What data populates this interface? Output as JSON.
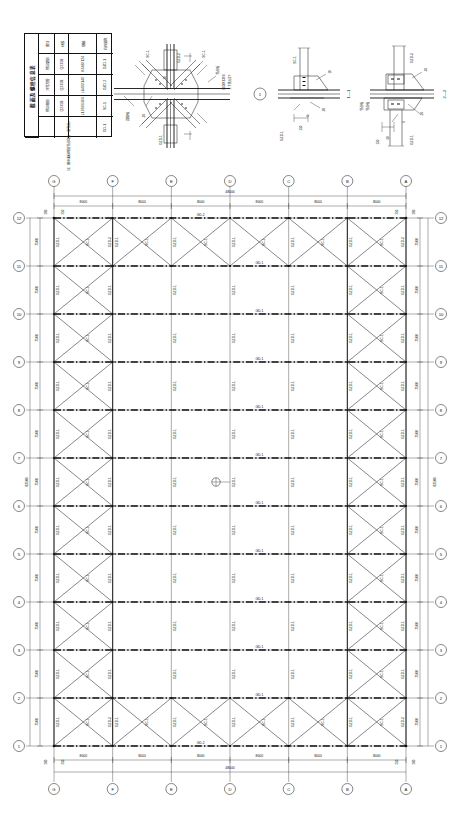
{
  "sheet": {
    "drawing_type": "structural-steel-bracing-plan",
    "units": "mm"
  },
  "material_table": {
    "title": "截面及螺栓信息表",
    "headers": [
      "构件名称",
      "规格",
      "材质",
      "备注"
    ],
    "rows": [
      {
        "name": "GZD-1",
        "spec": "H248X124",
        "material": "Q235B",
        "remark": "热轧型钢"
      },
      {
        "name": "GZD-2",
        "spec": "□140X140",
        "material": "Q235B",
        "remark": "冷弯方管"
      },
      {
        "name": "SC-1",
        "spec": "L100X63X6",
        "material": "Q235B",
        "remark": "热轧角钢"
      },
      {
        "name": "GD-1",
        "spec": "",
        "material": "",
        "remark": ""
      }
    ],
    "note": "注：图中未标明的节点均为一般节点。"
  },
  "details": [
    {
      "id": "detail-1",
      "tag": "1",
      "callouts": [
        "GZD-2",
        "SC-1",
        "SC-1",
        "GZD-1",
        "10",
        "-10",
        "连接板",
        "节点板",
        "L100X63X6",
        "上下各设2个"
      ]
    },
    {
      "id": "section-1-1",
      "tag": "1—1",
      "callouts": [
        "GZD-1",
        "SC-1",
        "10",
        "-10",
        "-20",
        "6",
        "连接板",
        "节点板",
        "150"
      ]
    },
    {
      "id": "section-2-2",
      "tag": "2—2",
      "callouts": [
        "GZD-2",
        "GZD-1",
        "-10",
        "-10",
        "6",
        "节点板",
        "连接板",
        "150",
        "50"
      ]
    }
  ],
  "plan": {
    "title": "支撑布置平面图",
    "top_grid_labels": [
      "G",
      "F",
      "E",
      "D",
      "C",
      "B",
      "A"
    ],
    "bottom_grid_labels": [
      "G",
      "F",
      "E",
      "D",
      "C",
      "B",
      "A"
    ],
    "left_grid_labels": [
      "12",
      "11",
      "10",
      "9",
      "8",
      "7",
      "6",
      "5",
      "4",
      "3",
      "2",
      "1"
    ],
    "right_grid_labels": [
      "12",
      "11",
      "10",
      "9",
      "8",
      "7",
      "6",
      "5",
      "4",
      "3",
      "2",
      "1"
    ],
    "horizontal_bay_dims": [
      "8000",
      "8000",
      "8000",
      "8000",
      "8000",
      "8000"
    ],
    "horizontal_total": "48000",
    "vertical_bay_dims": [
      "7500",
      "7500",
      "7500",
      "7500",
      "7500",
      "7500",
      "7500",
      "7500",
      "7500",
      "7500",
      "7500"
    ],
    "vertical_total": "82500",
    "edge_dims": [
      "200",
      "250",
      "250",
      "200",
      "200",
      "250",
      "250",
      "200"
    ],
    "member_labels": {
      "chord": "GD-1",
      "post_primary": "GZD-1",
      "post_secondary": "GZD-2",
      "diagonal": "SC-1"
    },
    "detail_marker": "1"
  }
}
